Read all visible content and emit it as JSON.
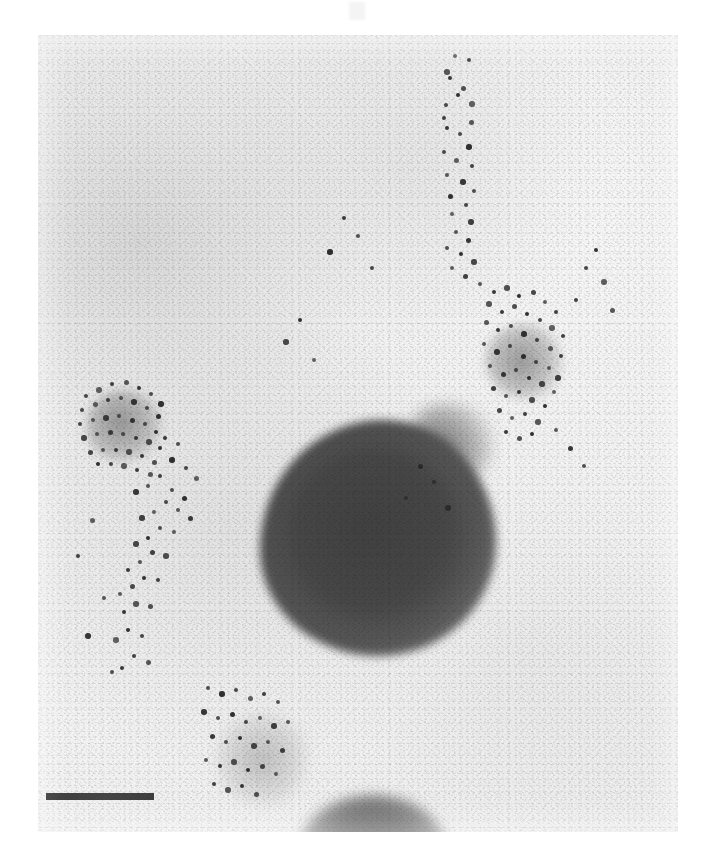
{
  "figure": {
    "kind": "transmission-electron-micrograph",
    "technique": "immunogold labeling",
    "caption": "",
    "plate": {
      "x": 38,
      "y": 35,
      "width": 640,
      "height": 797,
      "background_color": "#f1f1f1",
      "grain": true
    },
    "page_background_color": "#ffffff"
  },
  "scale_bar": {
    "label": "",
    "x": 46,
    "y": 793,
    "length_px": 108,
    "thickness_px": 7,
    "color": "#2e2e2e",
    "position": "bottom-left"
  },
  "top_mark": {
    "label": "",
    "x": 349,
    "y": 2,
    "width": 16,
    "height": 18,
    "color": "#f4f4f4"
  },
  "structures": [
    {
      "name": "main-dense-body",
      "description": "large pear-shaped electron-dense body",
      "center": [
        375,
        545
      ],
      "radius": 118,
      "tone": "#4a4a4a",
      "gold_labeled": false
    },
    {
      "name": "vesicle-left",
      "description": "small vesicle decorated with gold particles",
      "center": [
        124,
        426
      ],
      "radius": 38,
      "tone": "#8c8c8c",
      "gold_labeled": true
    },
    {
      "name": "vesicle-right",
      "description": "small vesicle decorated with gold particles",
      "center": [
        524,
        361
      ],
      "radius": 39,
      "tone": "#8c8c8c",
      "gold_labeled": true
    },
    {
      "name": "vesicle-lower",
      "description": "faint lower vesicle with sparse gold particles",
      "center": [
        262,
        759
      ],
      "radius": 46,
      "tone": "#b0b0b0",
      "gold_labeled": true
    },
    {
      "name": "edge-body-bottom",
      "description": "dense body clipped by the lower plate margin",
      "center": [
        373,
        855
      ],
      "radius": 75,
      "tone": "#6a6a6a",
      "gold_labeled": false
    }
  ],
  "gold_particles": {
    "color": "#2a2a2a",
    "diameter_px": 5,
    "total_visible": 186,
    "clusters": [
      {
        "name": "vesicle-left-rim",
        "center": [
          124,
          426
        ],
        "count": 34
      },
      {
        "name": "vesicle-right-rim",
        "center": [
          524,
          361
        ],
        "count": 38
      },
      {
        "name": "upper-trail",
        "center": [
          458,
          180
        ],
        "count": 22
      },
      {
        "name": "bridge-trail",
        "center": [
          470,
          300
        ],
        "count": 24
      },
      {
        "name": "left-diagonal-trail",
        "center": [
          190,
          560
        ],
        "count": 30
      },
      {
        "name": "vesicle-lower-rim",
        "center": [
          262,
          759
        ],
        "count": 20
      },
      {
        "name": "background-scatter",
        "center": [
          356,
          430
        ],
        "count": 18
      }
    ],
    "points": [
      [
        455,
        56
      ],
      [
        469,
        60
      ],
      [
        447,
        72
      ],
      [
        450,
        78
      ],
      [
        463,
        88
      ],
      [
        458,
        95
      ],
      [
        446,
        105
      ],
      [
        472,
        104
      ],
      [
        444,
        118
      ],
      [
        471,
        122
      ],
      [
        447,
        128
      ],
      [
        460,
        134
      ],
      [
        469,
        147
      ],
      [
        444,
        152
      ],
      [
        456,
        160
      ],
      [
        472,
        166
      ],
      [
        447,
        175
      ],
      [
        463,
        182
      ],
      [
        474,
        191
      ],
      [
        450,
        196
      ],
      [
        466,
        205
      ],
      [
        452,
        214
      ],
      [
        471,
        222
      ],
      [
        456,
        232
      ],
      [
        468,
        240
      ],
      [
        447,
        248
      ],
      [
        461,
        254
      ],
      [
        474,
        262
      ],
      [
        452,
        268
      ],
      [
        465,
        276
      ],
      [
        480,
        284
      ],
      [
        494,
        292
      ],
      [
        507,
        288
      ],
      [
        519,
        296
      ],
      [
        533,
        292
      ],
      [
        545,
        302
      ],
      [
        556,
        312
      ],
      [
        489,
        304
      ],
      [
        502,
        312
      ],
      [
        514,
        306
      ],
      [
        527,
        314
      ],
      [
        540,
        320
      ],
      [
        552,
        328
      ],
      [
        563,
        336
      ],
      [
        486,
        322
      ],
      [
        498,
        330
      ],
      [
        511,
        326
      ],
      [
        524,
        334
      ],
      [
        537,
        340
      ],
      [
        550,
        348
      ],
      [
        561,
        356
      ],
      [
        484,
        344
      ],
      [
        497,
        352
      ],
      [
        510,
        346
      ],
      [
        523,
        356
      ],
      [
        536,
        362
      ],
      [
        549,
        368
      ],
      [
        558,
        378
      ],
      [
        490,
        366
      ],
      [
        503,
        374
      ],
      [
        516,
        370
      ],
      [
        529,
        378
      ],
      [
        542,
        384
      ],
      [
        554,
        392
      ],
      [
        493,
        388
      ],
      [
        506,
        396
      ],
      [
        519,
        392
      ],
      [
        532,
        400
      ],
      [
        545,
        406
      ],
      [
        499,
        410
      ],
      [
        512,
        418
      ],
      [
        525,
        414
      ],
      [
        538,
        422
      ],
      [
        506,
        432
      ],
      [
        519,
        438
      ],
      [
        532,
        434
      ],
      [
        86,
        396
      ],
      [
        99,
        390
      ],
      [
        112,
        384
      ],
      [
        126,
        382
      ],
      [
        139,
        388
      ],
      [
        151,
        394
      ],
      [
        161,
        404
      ],
      [
        82,
        410
      ],
      [
        95,
        404
      ],
      [
        108,
        400
      ],
      [
        121,
        398
      ],
      [
        134,
        402
      ],
      [
        147,
        408
      ],
      [
        158,
        416
      ],
      [
        80,
        424
      ],
      [
        93,
        420
      ],
      [
        106,
        418
      ],
      [
        119,
        416
      ],
      [
        132,
        420
      ],
      [
        145,
        424
      ],
      [
        156,
        432
      ],
      [
        84,
        438
      ],
      [
        97,
        434
      ],
      [
        110,
        432
      ],
      [
        123,
        434
      ],
      [
        136,
        438
      ],
      [
        149,
        442
      ],
      [
        160,
        448
      ],
      [
        90,
        452
      ],
      [
        103,
        450
      ],
      [
        116,
        450
      ],
      [
        129,
        452
      ],
      [
        142,
        456
      ],
      [
        154,
        462
      ],
      [
        98,
        464
      ],
      [
        111,
        464
      ],
      [
        124,
        466
      ],
      [
        137,
        470
      ],
      [
        150,
        474
      ],
      [
        165,
        438
      ],
      [
        178,
        444
      ],
      [
        172,
        460
      ],
      [
        186,
        468
      ],
      [
        196,
        478
      ],
      [
        160,
        476
      ],
      [
        148,
        486
      ],
      [
        136,
        492
      ],
      [
        172,
        490
      ],
      [
        184,
        498
      ],
      [
        166,
        502
      ],
      [
        154,
        512
      ],
      [
        142,
        518
      ],
      [
        178,
        510
      ],
      [
        190,
        518
      ],
      [
        160,
        528
      ],
      [
        148,
        538
      ],
      [
        136,
        544
      ],
      [
        174,
        532
      ],
      [
        152,
        552
      ],
      [
        140,
        562
      ],
      [
        128,
        570
      ],
      [
        166,
        556
      ],
      [
        144,
        578
      ],
      [
        132,
        586
      ],
      [
        120,
        594
      ],
      [
        158,
        580
      ],
      [
        136,
        604
      ],
      [
        124,
        612
      ],
      [
        150,
        606
      ],
      [
        128,
        630
      ],
      [
        142,
        636
      ],
      [
        116,
        640
      ],
      [
        134,
        656
      ],
      [
        148,
        662
      ],
      [
        122,
        668
      ],
      [
        208,
        688
      ],
      [
        222,
        694
      ],
      [
        236,
        690
      ],
      [
        250,
        698
      ],
      [
        264,
        694
      ],
      [
        278,
        702
      ],
      [
        204,
        712
      ],
      [
        218,
        718
      ],
      [
        232,
        714
      ],
      [
        246,
        722
      ],
      [
        260,
        718
      ],
      [
        274,
        726
      ],
      [
        288,
        722
      ],
      [
        212,
        736
      ],
      [
        226,
        742
      ],
      [
        240,
        738
      ],
      [
        254,
        746
      ],
      [
        268,
        742
      ],
      [
        282,
        750
      ],
      [
        206,
        760
      ],
      [
        220,
        766
      ],
      [
        234,
        762
      ],
      [
        248,
        770
      ],
      [
        262,
        766
      ],
      [
        276,
        774
      ],
      [
        214,
        784
      ],
      [
        228,
        790
      ],
      [
        242,
        786
      ],
      [
        256,
        794
      ],
      [
        596,
        250
      ],
      [
        586,
        268
      ],
      [
        604,
        282
      ],
      [
        576,
        300
      ],
      [
        612,
        310
      ],
      [
        344,
        218
      ],
      [
        358,
        236
      ],
      [
        330,
        252
      ],
      [
        372,
        268
      ],
      [
        92,
        520
      ],
      [
        78,
        556
      ],
      [
        104,
        598
      ],
      [
        88,
        636
      ],
      [
        112,
        672
      ],
      [
        420,
        466
      ],
      [
        434,
        482
      ],
      [
        406,
        498
      ],
      [
        448,
        508
      ],
      [
        556,
        430
      ],
      [
        570,
        448
      ],
      [
        584,
        466
      ],
      [
        300,
        320
      ],
      [
        286,
        342
      ],
      [
        314,
        360
      ]
    ]
  }
}
